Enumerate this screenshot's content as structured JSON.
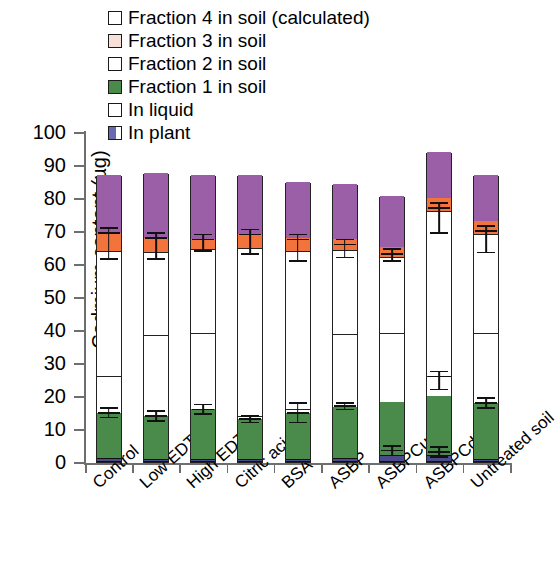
{
  "chart_data": {
    "type": "bar",
    "subtype": "stacked-bar-with-error-bars",
    "title": "",
    "xlabel": "",
    "ylabel": "Cadmium content (µg)",
    "ylim": [
      0,
      100
    ],
    "yticks": [
      0,
      10,
      20,
      30,
      40,
      50,
      60,
      70,
      80,
      90,
      100
    ],
    "grid": false,
    "legend_position": "top-center",
    "categories": [
      "Control",
      "Low EDTA",
      "High EDTA",
      "Citric acid",
      "BSA",
      "ASBP",
      "ASBPCu",
      "ASBPCd",
      "Untreated soil"
    ],
    "series": [
      {
        "name": "In plant",
        "color": "#4a4a8c",
        "values": [
          1.2,
          1.0,
          1.0,
          1.0,
          1.0,
          1.2,
          2.2,
          2.0,
          1.0
        ]
      },
      {
        "name": "Fraction 1 in soil",
        "color": "#4a8a4a",
        "values": [
          13.8,
          13.0,
          15.0,
          12.0,
          14.0,
          15.5,
          16.0,
          18.0,
          17.0
        ]
      },
      {
        "name": "In liquid",
        "color": "#ffffff",
        "values": [
          11.0,
          24.5,
          23.0,
          1.0,
          1.0,
          22.0,
          21.0,
          6.0,
          21.0
        ]
      },
      {
        "name": "Fraction 2 in soil",
        "color": "#ffffff",
        "values": [
          38.0,
          25.0,
          25.5,
          51.0,
          48.0,
          25.5,
          23.0,
          50.0,
          30.0
        ]
      },
      {
        "name": "Fraction 3 in soil",
        "color": "#f2733c",
        "values": [
          5.5,
          4.5,
          3.0,
          4.0,
          4.0,
          3.5,
          3.0,
          4.0,
          4.0
        ]
      },
      {
        "name": "Fraction 4 in soil (calculated)",
        "color": "#9b5fa8",
        "values": [
          17.5,
          19.5,
          19.5,
          18.0,
          17.0,
          16.5,
          15.5,
          14.0,
          14.0
        ]
      }
    ],
    "totals": [
      87.0,
      87.5,
      87.0,
      87.0,
      85.0,
      84.2,
      80.7,
      94.0,
      87.0
    ],
    "error_bars": [
      {
        "category": "Control",
        "value": 69.5,
        "err_up": 1.5,
        "err_down": 8.0
      },
      {
        "category": "Control",
        "value": 15.0,
        "err_up": 1.5,
        "err_down": 1.5
      },
      {
        "category": "Low EDTA",
        "value": 68.0,
        "err_up": 1.5,
        "err_down": 6.5
      },
      {
        "category": "Low EDTA",
        "value": 14.0,
        "err_up": 1.5,
        "err_down": 1.5
      },
      {
        "category": "High EDTA",
        "value": 67.5,
        "err_up": 1.5,
        "err_down": 3.5
      },
      {
        "category": "High EDTA",
        "value": 16.0,
        "err_up": 1.5,
        "err_down": 1.5
      },
      {
        "category": "Citric acid",
        "value": 69.0,
        "err_up": 1.5,
        "err_down": 6.0
      },
      {
        "category": "Citric acid",
        "value": 13.0,
        "err_up": 1.0,
        "err_down": 1.0
      },
      {
        "category": "BSA",
        "value": 67.5,
        "err_up": 1.5,
        "err_down": 6.5
      },
      {
        "category": "BSA",
        "value": 15.0,
        "err_up": 3.0,
        "err_down": 3.0
      },
      {
        "category": "ASBP",
        "value": 66.0,
        "err_up": 1.5,
        "err_down": 4.0
      },
      {
        "category": "ASBP",
        "value": 17.0,
        "err_up": 1.0,
        "err_down": 1.0
      },
      {
        "category": "ASBPCu",
        "value": 63.0,
        "err_up": 1.5,
        "err_down": 2.0
      },
      {
        "category": "ASBPCu",
        "value": 3.5,
        "err_up": 1.5,
        "err_down": 1.5
      },
      {
        "category": "ASBPCd",
        "value": 77.0,
        "err_up": 1.5,
        "err_down": 7.5
      },
      {
        "category": "ASBPCd",
        "value": 26.0,
        "err_up": 1.5,
        "err_down": 4.0
      },
      {
        "category": "ASBPCd",
        "value": 3.0,
        "err_up": 1.5,
        "err_down": 1.5
      },
      {
        "category": "Untreated soil",
        "value": 70.0,
        "err_up": 1.5,
        "err_down": 6.5
      },
      {
        "category": "Untreated soil",
        "value": 18.0,
        "err_up": 1.5,
        "err_down": 1.5
      }
    ]
  },
  "legend": {
    "items": [
      {
        "label": "Fraction 4 in soil (calculated)",
        "color": "#ffffff",
        "swatch": "open-square"
      },
      {
        "label": "Fraction 3 in soil",
        "color": "#f6e0d8",
        "swatch": "open-square"
      },
      {
        "label": "Fraction 2 in soil",
        "color": "#ffffff",
        "swatch": "open-square"
      },
      {
        "label": "Fraction 1 in soil",
        "color": "#4a8a4a",
        "swatch": "filled-square"
      },
      {
        "label": "In liquid",
        "color": "#ffffff",
        "swatch": "open-square"
      },
      {
        "label": "In plant",
        "color": "#4a4a8c",
        "swatch": "half-filled-square"
      }
    ]
  },
  "axes": {
    "y_title": "Cadmium content (µg)",
    "y_tick_labels": [
      "100",
      "90",
      "80",
      "70",
      "60",
      "50",
      "40",
      "30",
      "20",
      "10",
      "0"
    ],
    "x_tick_labels": [
      "Control",
      "Low EDTA",
      "High EDTA",
      "Citric acid",
      "BSA",
      "ASBP",
      "ASBPCu",
      "ASBPCd",
      "Untreated soil"
    ]
  }
}
